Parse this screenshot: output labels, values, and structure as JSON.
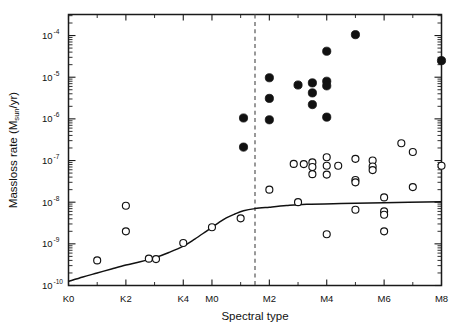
{
  "figure": {
    "background_color": "#ffffff",
    "frame_color": "#1a1a1a",
    "marker_color": "#111111",
    "curve_color": "#111111",
    "dashed_line_color": "#555555"
  },
  "chart_data": {
    "type": "scatter",
    "title": "",
    "xlabel": "Spectral type",
    "ylabel": "Massloss rate (M",
    "ylabel_sub": "sun",
    "ylabel_tail": "/yr)",
    "grid": false,
    "legend_position": "none",
    "yscale": "log",
    "ylim": [
      1e-10,
      0.00032
    ],
    "xlim": [
      0,
      13
    ],
    "x_tick_labels": [
      "K0",
      "K2",
      "K4",
      "M0",
      "M2",
      "M4",
      "M6",
      "M8"
    ],
    "x_tick_values": [
      0,
      2,
      4,
      5,
      7,
      9,
      11,
      13
    ],
    "x_minor_tick_values": [
      1,
      3,
      6,
      8,
      10,
      12
    ],
    "y_tick_labels": [
      "10",
      "10",
      "10",
      "10",
      "10",
      "10",
      "10"
    ],
    "y_tick_exponents": [
      "-4",
      "-5",
      "-6",
      "-7",
      "-8",
      "-9",
      "-10"
    ],
    "y_tick_values": [
      0.0001,
      1e-05,
      1e-06,
      1e-07,
      1e-08,
      1e-09,
      1e-10
    ],
    "annotations": [
      {
        "name": "spectral-type-divider",
        "type": "vertical-dashed-line",
        "x": 6.5,
        "label": ""
      }
    ],
    "series": [
      {
        "name": "filled-circles",
        "marker": "filled-circle",
        "color": "#111111",
        "points": [
          {
            "x": 6.1,
            "y": 1.05e-06
          },
          {
            "x": 6.1,
            "y": 2.1e-07
          },
          {
            "x": 7.0,
            "y": 9.7e-06
          },
          {
            "x": 7.0,
            "y": 3.1e-06
          },
          {
            "x": 7.0,
            "y": 9.5e-07
          },
          {
            "x": 8.0,
            "y": 6.5e-06
          },
          {
            "x": 8.5,
            "y": 7.3e-06
          },
          {
            "x": 8.5,
            "y": 4.2e-06
          },
          {
            "x": 8.5,
            "y": 2.2e-06
          },
          {
            "x": 9.0,
            "y": 8e-06
          },
          {
            "x": 9.0,
            "y": 6.2e-06
          },
          {
            "x": 9.0,
            "y": 4.2e-05
          },
          {
            "x": 9.0,
            "y": 1.1e-06
          },
          {
            "x": 10.0,
            "y": 0.000105
          },
          {
            "x": 13.0,
            "y": 2.5e-05
          }
        ]
      },
      {
        "name": "open-circles",
        "marker": "open-circle",
        "color": "#111111",
        "points": [
          {
            "x": 1.0,
            "y": 4e-10
          },
          {
            "x": 2.0,
            "y": 8.2e-09
          },
          {
            "x": 2.0,
            "y": 2e-09
          },
          {
            "x": 2.8,
            "y": 4.4e-10
          },
          {
            "x": 3.05,
            "y": 4.3e-10
          },
          {
            "x": 4.0,
            "y": 1.05e-09
          },
          {
            "x": 5.0,
            "y": 2.5e-09
          },
          {
            "x": 6.0,
            "y": 4.1e-09
          },
          {
            "x": 7.0,
            "y": 2e-08
          },
          {
            "x": 7.85,
            "y": 8.3e-08
          },
          {
            "x": 8.2,
            "y": 8.2e-08
          },
          {
            "x": 8.5,
            "y": 9e-08
          },
          {
            "x": 8.5,
            "y": 7e-08
          },
          {
            "x": 8.5,
            "y": 4.7e-08
          },
          {
            "x": 8.0,
            "y": 1e-08
          },
          {
            "x": 9.0,
            "y": 1.2e-07
          },
          {
            "x": 9.0,
            "y": 7.5e-08
          },
          {
            "x": 9.0,
            "y": 4.6e-08
          },
          {
            "x": 9.0,
            "y": 1.7e-09
          },
          {
            "x": 9.4,
            "y": 7.5e-08
          },
          {
            "x": 10.0,
            "y": 1.1e-07
          },
          {
            "x": 10.0,
            "y": 3.4e-08
          },
          {
            "x": 10.0,
            "y": 3e-08
          },
          {
            "x": 10.0,
            "y": 6.6e-09
          },
          {
            "x": 10.6,
            "y": 1e-07
          },
          {
            "x": 10.6,
            "y": 7.2e-08
          },
          {
            "x": 10.6,
            "y": 5.9e-08
          },
          {
            "x": 11.0,
            "y": 1.3e-08
          },
          {
            "x": 11.0,
            "y": 6e-09
          },
          {
            "x": 11.0,
            "y": 5e-09
          },
          {
            "x": 11.0,
            "y": 2e-09
          },
          {
            "x": 11.6,
            "y": 2.6e-07
          },
          {
            "x": 12.0,
            "y": 1.6e-07
          },
          {
            "x": 12.0,
            "y": 2.3e-08
          },
          {
            "x": 13.0,
            "y": 7.5e-08
          }
        ]
      }
    ],
    "curve": {
      "name": "model-curve",
      "color": "#111111",
      "points": [
        {
          "x": 0.0,
          "y": 1.25e-10
        },
        {
          "x": 0.5,
          "y": 1.6e-10
        },
        {
          "x": 1.0,
          "y": 2e-10
        },
        {
          "x": 1.5,
          "y": 2.5e-10
        },
        {
          "x": 2.0,
          "y": 3.1e-10
        },
        {
          "x": 2.5,
          "y": 3.7e-10
        },
        {
          "x": 3.0,
          "y": 4.6e-10
        },
        {
          "x": 3.5,
          "y": 6.2e-10
        },
        {
          "x": 4.0,
          "y": 8.8e-10
        },
        {
          "x": 4.4,
          "y": 1.3e-09
        },
        {
          "x": 4.8,
          "y": 2e-09
        },
        {
          "x": 5.2,
          "y": 3.1e-09
        },
        {
          "x": 5.5,
          "y": 4.2e-09
        },
        {
          "x": 5.8,
          "y": 5.2e-09
        },
        {
          "x": 6.1,
          "y": 6.2e-09
        },
        {
          "x": 6.5,
          "y": 7e-09
        },
        {
          "x": 7.0,
          "y": 7.6e-09
        },
        {
          "x": 7.6,
          "y": 8.3e-09
        },
        {
          "x": 8.3,
          "y": 8.9e-09
        },
        {
          "x": 9.5,
          "y": 9.3e-09
        },
        {
          "x": 11.0,
          "y": 9.7e-09
        },
        {
          "x": 13.0,
          "y": 1.02e-08
        }
      ]
    }
  }
}
